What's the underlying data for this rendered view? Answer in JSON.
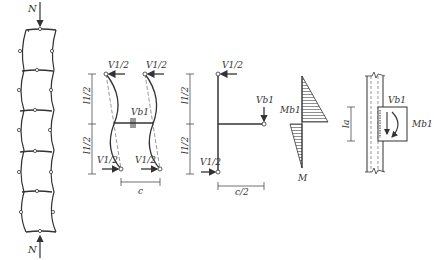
{
  "figure": {
    "panel_a": {
      "load_top": "N",
      "load_bottom": "N"
    },
    "panel_b": {
      "shear_top_left": "V1/2",
      "shear_top_right": "V1/2",
      "shear_bottom_left": "V1/2",
      "shear_bottom_right": "V1/2",
      "beam_shear": "Vb1",
      "dim_upper": "l1/2",
      "dim_lower": "l1/2",
      "dim_width": "c"
    },
    "panel_c": {
      "shear_top": "V1/2",
      "shear_bottom": "V1/2",
      "beam_shear": "Vb1",
      "dim_upper": "l1/2",
      "dim_lower": "l1/2",
      "dim_width": "c/2"
    },
    "panel_d": {
      "moment_label": "Mb1",
      "diagram_label": "M"
    },
    "panel_e": {
      "shear_label": "Vb1",
      "moment_label": "Mb1",
      "dim_label": "la"
    }
  }
}
